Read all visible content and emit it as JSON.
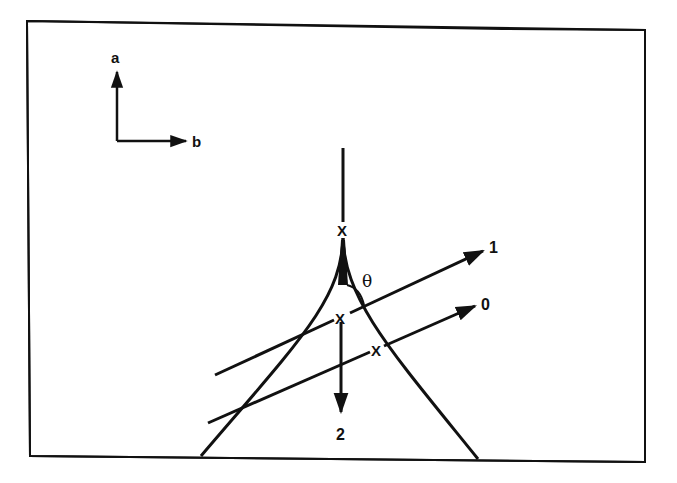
{
  "diagram": {
    "axes": {
      "vertical_label": "a",
      "horizontal_label": "b"
    },
    "beams": [
      {
        "id": "1",
        "label": "1"
      },
      {
        "id": "0",
        "label": "0"
      },
      {
        "id": "2",
        "label": "2"
      }
    ],
    "angle_label": "θ",
    "marker_symbol": "X",
    "colors": {
      "ink": "#111111",
      "background": "#ffffff"
    }
  }
}
